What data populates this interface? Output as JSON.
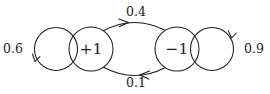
{
  "diagram": {
    "type": "markov-chain-state-diagram",
    "background_color": "#ffffff",
    "stroke_color": "#1c1c1c",
    "states": [
      {
        "id": "state-plus-one",
        "label": "+1",
        "cx": 91,
        "cy": 49,
        "r": 22
      },
      {
        "id": "state-minus-one",
        "label": "−1",
        "cx": 177,
        "cy": 49,
        "r": 22
      }
    ],
    "self_loops": [
      {
        "id": "self-loop-plus-one",
        "from": "state-plus-one",
        "to": "state-plus-one",
        "probability": "0.6",
        "label_x": 13,
        "label_y": 49,
        "side": "left"
      },
      {
        "id": "self-loop-minus-one",
        "from": "state-minus-one",
        "to": "state-minus-one",
        "probability": "0.9",
        "label_x": 254,
        "label_y": 49,
        "side": "right"
      }
    ],
    "transitions": [
      {
        "id": "transition-plus-to-minus",
        "from": "state-plus-one",
        "to": "state-minus-one",
        "probability": "0.4",
        "label_x": 136,
        "label_y": 12,
        "position": "top",
        "direction": "right"
      },
      {
        "id": "transition-minus-to-plus",
        "from": "state-minus-one",
        "to": "state-plus-one",
        "probability": "0.1",
        "label_x": 136,
        "label_y": 83,
        "position": "bottom",
        "direction": "left"
      }
    ]
  }
}
